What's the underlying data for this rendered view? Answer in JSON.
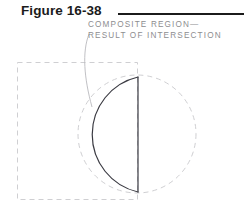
{
  "figure": {
    "title": "Figure 16-38",
    "title_rule": true
  },
  "annotation": {
    "line1": "COMPOSITE REGION—",
    "line2": "RESULT OF INTERSECTION",
    "leader_line": "leader-line"
  },
  "colors": {
    "title_text": "#1b1b1b",
    "title_rule": "#1b1b1b",
    "annotation_text": "#8d8d8f",
    "construction_line": "#cfcfd2",
    "composite_outline": "#3a3a42",
    "background": "#ffffff"
  },
  "geometry": {
    "rectangle": {
      "name": "construction-rectangle",
      "style": "dashed",
      "x": 17,
      "y": 62,
      "width": 121,
      "height": 138
    },
    "circle": {
      "name": "construction-circle",
      "style": "dashed",
      "cx": 137,
      "cy": 134,
      "r": 59
    },
    "composite_region": {
      "name": "composite-region",
      "style": "solid",
      "description": "Intersection of rectangle and circle — half-circle lens bounded by the rectangle's right edge on the right and the circle's left arc on the left.",
      "chord_x": 138,
      "chord_top_y": 77,
      "chord_bottom_y": 192,
      "arc_leftmost_x": 80,
      "arc_leftmost_y": 135
    }
  }
}
